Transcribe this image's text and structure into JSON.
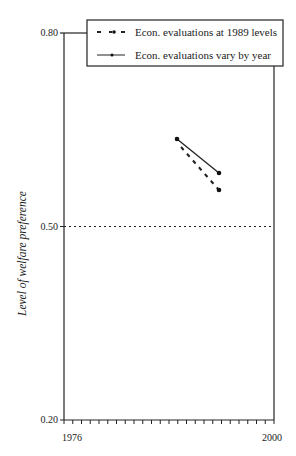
{
  "chart_data": {
    "type": "line",
    "title": "",
    "xlabel": "",
    "ylabel": "Level of welfare preference",
    "xlim": [
      1976,
      2000
    ],
    "ylim": [
      0.2,
      0.8
    ],
    "x_tick_labels": [
      "1976",
      "2000"
    ],
    "y_tick_labels": [
      "0.20",
      "0.50",
      "0.80"
    ],
    "reference_line": {
      "y": 0.5,
      "style": "dotted"
    },
    "grid": false,
    "legend_position": "top",
    "series": [
      {
        "name": "Econ. evaluations at 1989 levels",
        "style": "dashed",
        "x": [
          1989,
          1994
        ],
        "values": [
          0.64,
          0.56
        ]
      },
      {
        "name": "Econ. evaluations vary by year",
        "style": "solid",
        "x": [
          1989,
          1994
        ],
        "values": [
          0.64,
          0.58
        ]
      }
    ]
  },
  "axes": {
    "ylabel": "Level of welfare preference",
    "y_ticks": [
      "0.80",
      "0.50",
      "0.20"
    ],
    "x_ticks": [
      "1976",
      "2000"
    ]
  },
  "legend": {
    "items": [
      "Econ. evaluations at 1989 levels",
      "Econ. evaluations vary by year"
    ]
  }
}
